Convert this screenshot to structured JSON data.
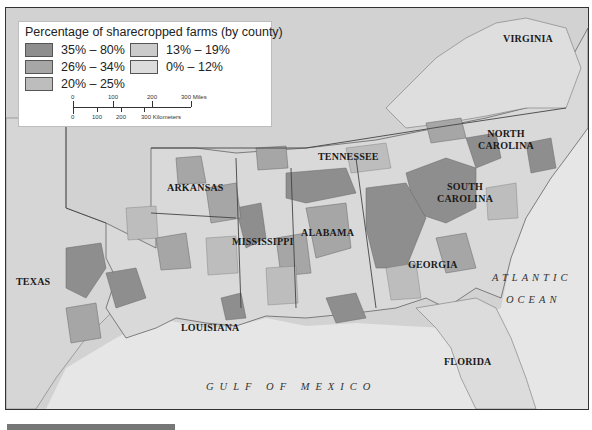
{
  "legend": {
    "title": "Percentage of sharecropped farms (by county)",
    "items": [
      {
        "label": "35% – 80%",
        "color": "#8e8e8e"
      },
      {
        "label": "26% – 34%",
        "color": "#a6a6a6"
      },
      {
        "label": "20% – 25%",
        "color": "#bdbdbd"
      },
      {
        "label": "13% – 19%",
        "color": "#cbcbcb"
      },
      {
        "label": "0% – 12%",
        "color": "#dcdcdc"
      }
    ],
    "scale": {
      "miles_ticks": [
        "0",
        "100",
        "200",
        "300 Miles"
      ],
      "km_ticks": [
        "0",
        "100",
        "200",
        "300 Kilometers"
      ]
    }
  },
  "states": {
    "virginia": "VIRGINIA",
    "north_carolina": "NORTH CAROLINA",
    "tennessee": "TENNESSEE",
    "arkansas": "ARKANSAS",
    "south_carolina": "SOUTH CAROLINA",
    "mississippi": "MISSISSIPPI",
    "alabama": "ALABAMA",
    "texas": "TEXAS",
    "georgia": "GEORGIA",
    "louisiana": "LOUISIANA",
    "florida": "FLORIDA"
  },
  "water": {
    "atlantic_1": "ATLANTIC",
    "atlantic_2": "OCEAN",
    "gulf": "GULF OF MEXICO"
  },
  "colors": {
    "background_land_outside": "#cfcfcf",
    "water": "#e6e6e6",
    "border": "#555555"
  }
}
